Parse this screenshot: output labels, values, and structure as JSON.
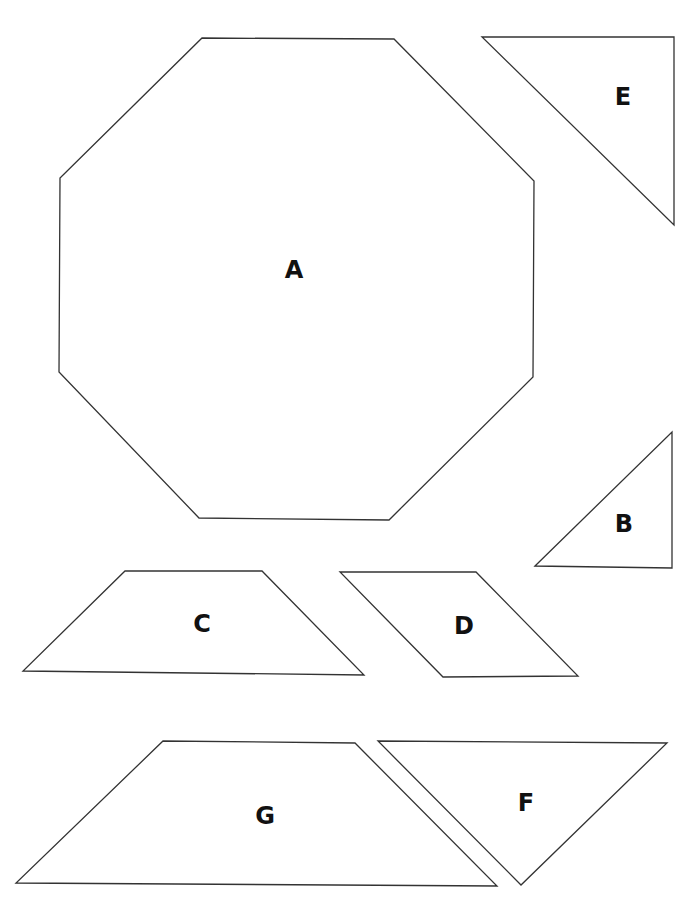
{
  "diagram": {
    "title": "",
    "stroke_color": "#333333",
    "label_color": "#111111",
    "shapes": [
      {
        "id": "A",
        "label": "A",
        "type": "octagon",
        "points": "202,38 394,39 534,181 533,377 389,520 199,518 59,372 60,178",
        "label_x": 294,
        "label_y": 270
      },
      {
        "id": "E",
        "label": "E",
        "type": "right-triangle",
        "points": "482,37 674,37 674,225",
        "label_x": 623,
        "label_y": 97
      },
      {
        "id": "B",
        "label": "B",
        "type": "right-triangle",
        "points": "535,566 672,432 672,568",
        "label_x": 624,
        "label_y": 524
      },
      {
        "id": "C",
        "label": "C",
        "type": "trapezoid",
        "points": "125,571 262,571 364,675 23,671",
        "label_x": 202,
        "label_y": 624
      },
      {
        "id": "D",
        "label": "D",
        "type": "parallelogram",
        "points": "340,572 476,572 578,676 443,677",
        "label_x": 464,
        "label_y": 626
      },
      {
        "id": "G",
        "label": "G",
        "type": "trapezoid",
        "points": "163,741 355,743 497,886 16,883",
        "label_x": 265,
        "label_y": 816
      },
      {
        "id": "F",
        "label": "F",
        "type": "triangle",
        "points": "378,741 667,743 521,885",
        "label_x": 526,
        "label_y": 803
      }
    ]
  }
}
